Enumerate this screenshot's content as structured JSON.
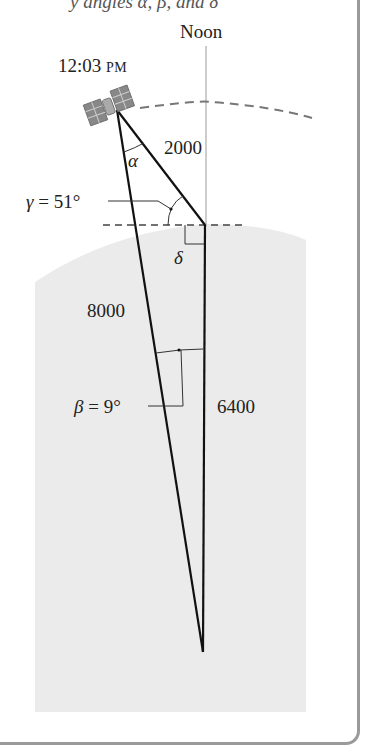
{
  "caption_fragment": "y angles α, β, and δ",
  "labels": {
    "noon": "Noon",
    "time_main": "12:03",
    "time_suffix": "PM",
    "alpha": "α",
    "distance_sat_to_top": "2000",
    "gamma_sym": "γ",
    "gamma_val": " = 51°",
    "delta": "δ",
    "distance_sat_to_center": "8000",
    "beta_sym": "β",
    "beta_val": " = 9°",
    "radius": "6400"
  },
  "colors": {
    "earth": "#ebebeb",
    "line": "#111111",
    "guide": "#888888",
    "frame": "#9a9a9a"
  }
}
